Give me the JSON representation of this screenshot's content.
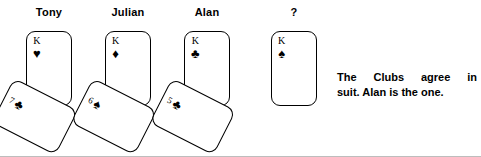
{
  "figure": {
    "caption_line_1": "The Clubs agree in",
    "caption_line_2": "suit. Alan is the one.",
    "caption_full": "The Clubs agree in suit. Alan is the one.",
    "ink_color": "#000000",
    "background_color": "#ffffff"
  },
  "columns": [
    {
      "label": "Tony",
      "upright_card": {
        "rank": "K",
        "suit_name": "heart",
        "suit_glyph": "♥"
      },
      "tilted_card": {
        "rank": "7",
        "suit_name": "club",
        "suit_glyph": "♣"
      }
    },
    {
      "label": "Julian",
      "upright_card": {
        "rank": "K",
        "suit_name": "diamond",
        "suit_glyph": "♦"
      },
      "tilted_card": {
        "rank": "6",
        "suit_name": "spade",
        "suit_glyph": "♠"
      }
    },
    {
      "label": "Alan",
      "upright_card": {
        "rank": "K",
        "suit_name": "club",
        "suit_glyph": "♣"
      },
      "tilted_card": {
        "rank": "5",
        "suit_name": "club",
        "suit_glyph": "♣"
      }
    },
    {
      "label": "?",
      "upright_card": {
        "rank": "K",
        "suit_name": "spade",
        "suit_glyph": "♠"
      },
      "tilted_card": null
    }
  ]
}
